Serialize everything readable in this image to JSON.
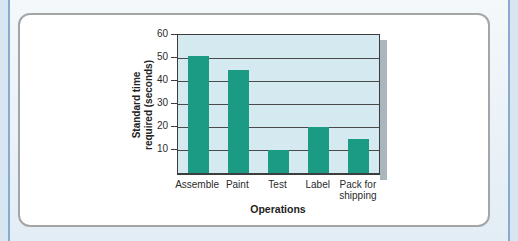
{
  "page": {
    "background_color": "#e9f1f7",
    "edge_rule_color": "#86abce"
  },
  "card": {
    "background_color": "#ffffff",
    "border_color": "#a3a5a7"
  },
  "chart_data": {
    "type": "bar",
    "categories": [
      "Assemble",
      "Paint",
      "Test",
      "Label",
      "Pack for shipping"
    ],
    "values": [
      51,
      45,
      10,
      20,
      15
    ],
    "title": "",
    "xlabel": "Operations",
    "ylabel": "Standard time required (seconds)",
    "ylabel_lines": [
      "Standard time",
      "required (seconds)"
    ],
    "ylim": [
      0,
      60
    ],
    "yticks": [
      60,
      50,
      40,
      30,
      20,
      10
    ],
    "grid": true,
    "legend": false,
    "bar_color": "#1b9b84",
    "plot_background": "#d5e9f1",
    "gridline_color": "#4a4a4a",
    "axis_color": "#3d3d3d",
    "shadow_color": "#aab6bd"
  }
}
